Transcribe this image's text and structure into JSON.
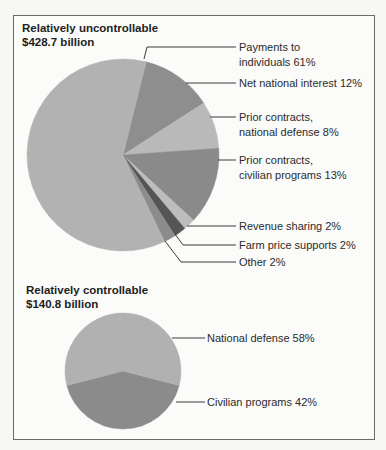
{
  "chart_data": [
    {
      "type": "pie",
      "title": "Relatively uncontrollable",
      "subtitle": "$428.7 billion",
      "total_billion": 428.7,
      "start_angle_deg": -76,
      "slices": [
        {
          "label_lines": [
            "Net national interest 12%"
          ],
          "name": "Net national interest",
          "value": 12,
          "color": "#8e8e8e"
        },
        {
          "label_lines": [
            "Prior contracts,",
            "national defense 8%"
          ],
          "name": "Prior contracts, national defense",
          "value": 8,
          "color": "#b9b9b9"
        },
        {
          "label_lines": [
            "Prior contracts,",
            "civilian programs 13%"
          ],
          "name": "Prior contracts, civilian programs",
          "value": 13,
          "color": "#8a8a8a"
        },
        {
          "label_lines": [
            "Revenue sharing 2%"
          ],
          "name": "Revenue sharing",
          "value": 2,
          "color": "#bdbdbd"
        },
        {
          "label_lines": [
            "Farm price supports 2%"
          ],
          "name": "Farm price supports",
          "value": 2,
          "color": "#555555"
        },
        {
          "label_lines": [
            "Other 2%"
          ],
          "name": "Other",
          "value": 2,
          "color": "#8c8c8c"
        },
        {
          "label_lines": [
            "Payments to",
            "individuals 61%"
          ],
          "name": "Payments to individuals",
          "value": 61,
          "color": "#b2b2b2"
        }
      ]
    },
    {
      "type": "pie",
      "title": "Relatively controllable",
      "subtitle": "$140.8 billion",
      "total_billion": 140.8,
      "slices": [
        {
          "label_lines": [
            "National defense 58%"
          ],
          "name": "National defense",
          "value": 58,
          "color": "#b1b1b1"
        },
        {
          "label_lines": [
            "Civilian programs 42%"
          ],
          "name": "Civilian programs",
          "value": 42,
          "color": "#8b8b8b"
        }
      ]
    }
  ],
  "headings": {
    "uncontrollable": {
      "title": "Relatively uncontrollable",
      "amount": "$428.7 billion"
    },
    "controllable": {
      "title": "Relatively controllable",
      "amount": "$140.8 billion"
    }
  },
  "labels": {
    "payments": [
      "Payments to",
      "individuals 61%"
    ],
    "net_interest": "Net national interest 12%",
    "prior_defense": [
      "Prior contracts,",
      "national defense 8%"
    ],
    "prior_civilian": [
      "Prior contracts,",
      "civilian programs 13%"
    ],
    "revenue_sharing": "Revenue sharing 2%",
    "farm": "Farm price supports 2%",
    "other": "Other 2%",
    "national_defense": "National defense 58%",
    "civilian_programs": "Civilian programs 42%"
  },
  "colors": {
    "frame": "#6a6a6a",
    "leader": "#3a3a3a"
  }
}
